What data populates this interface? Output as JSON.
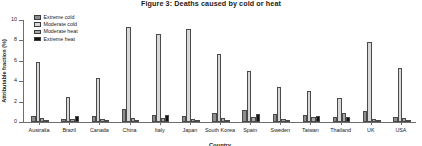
{
  "figure": {
    "title": "Figure 3: Deaths caused by cold or heat",
    "xlabel": "Country",
    "ylabel": "Attributable fraction (%)"
  },
  "legend": {
    "position": "top-left",
    "entries": [
      {
        "label": "Extreme cold",
        "color": "#8e8e8e"
      },
      {
        "label": "Moderate cold",
        "color": "#d9d9d9"
      },
      {
        "label": "Moderate heat",
        "color": "#a8a8a8"
      },
      {
        "label": "Extreme heat",
        "color": "#121212"
      }
    ]
  },
  "yaxis": {
    "ticks": [
      "10",
      "8",
      "6",
      "4",
      "2",
      "0"
    ],
    "min": 0,
    "max": 10
  },
  "chart_data": {
    "type": "bar",
    "title": "Figure 3: Deaths caused by cold or heat",
    "xlabel": "Country",
    "ylabel": "Attributable fraction (%)",
    "ylim": [
      0,
      10
    ],
    "grid": false,
    "legend_position": "top-left",
    "categories": [
      "Australia",
      "Brazil",
      "Canada",
      "China",
      "Italy",
      "Japan",
      "South Korea",
      "Spain",
      "Sweden",
      "Taiwan",
      "Thailand",
      "UK",
      "USA"
    ],
    "series": [
      {
        "name": "Extreme cold",
        "color": "#8e8e8e",
        "values": [
          0.6,
          0.3,
          0.6,
          1.3,
          0.7,
          0.6,
          0.9,
          1.2,
          0.8,
          0.7,
          0.5,
          1.1,
          0.5
        ]
      },
      {
        "name": "Moderate cold",
        "color": "#d9d9d9",
        "values": [
          5.9,
          2.5,
          4.3,
          9.3,
          8.6,
          9.1,
          6.7,
          5.0,
          3.4,
          3.0,
          2.4,
          7.8,
          5.3
        ]
      },
      {
        "name": "Moderate heat",
        "color": "#a8a8a8",
        "values": [
          0.4,
          0.3,
          0.3,
          0.4,
          0.4,
          0.3,
          0.4,
          0.5,
          0.3,
          0.5,
          0.9,
          0.3,
          0.4
        ]
      },
      {
        "name": "Extreme heat",
        "color": "#121212",
        "values": [
          0.1,
          0.6,
          0.1,
          0.1,
          0.7,
          0.1,
          0.2,
          0.8,
          0.2,
          0.6,
          0.5,
          0.1,
          0.2
        ]
      }
    ]
  }
}
